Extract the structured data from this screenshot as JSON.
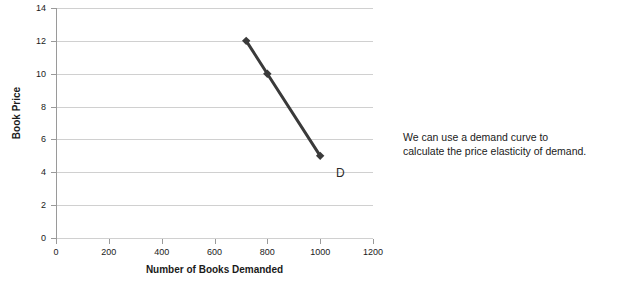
{
  "chart_data": {
    "type": "line",
    "title": "",
    "xlabel": "Number of Books Demanded",
    "ylabel": "Book Price",
    "xlim": [
      0,
      1200
    ],
    "ylim": [
      0,
      14
    ],
    "xticks": [
      0,
      200,
      400,
      600,
      800,
      1000,
      1200
    ],
    "yticks": [
      0,
      2,
      4,
      6,
      8,
      10,
      12,
      14
    ],
    "grid": "horizontal",
    "legend": "none",
    "series": [
      {
        "name": "D",
        "marker": "diamond",
        "color": "#3a3a3a",
        "x": [
          720,
          800,
          1000
        ],
        "y": [
          12,
          10,
          5
        ]
      }
    ],
    "annotations": [
      {
        "text": "D",
        "x": 1060,
        "y": 4.3
      }
    ]
  },
  "note": {
    "line1": "We can use a demand curve to",
    "line2": "calculate the price elasticity of demand."
  }
}
